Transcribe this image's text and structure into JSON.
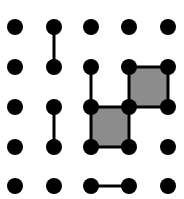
{
  "game": {
    "name": "Dots and Boxes",
    "grid": {
      "cols": 5,
      "rows": 5
    },
    "dot_x": [
      15,
      54,
      91,
      129,
      168
    ],
    "dot_y": [
      27,
      67,
      107,
      147,
      186
    ],
    "dot_radius": 8,
    "colors": {
      "dot": "#000000",
      "line": "#000000",
      "box_fill": "#8c8c8c",
      "background": "#ffffff"
    },
    "lines": [
      {
        "from": [
          1,
          0
        ],
        "to": [
          1,
          1
        ]
      },
      {
        "from": [
          2,
          1
        ],
        "to": [
          2,
          2
        ]
      },
      {
        "from": [
          3,
          1
        ],
        "to": [
          4,
          1
        ]
      },
      {
        "from": [
          3,
          1
        ],
        "to": [
          3,
          2
        ]
      },
      {
        "from": [
          4,
          1
        ],
        "to": [
          4,
          2
        ]
      },
      {
        "from": [
          3,
          2
        ],
        "to": [
          4,
          2
        ]
      },
      {
        "from": [
          2,
          2
        ],
        "to": [
          3,
          2
        ]
      },
      {
        "from": [
          2,
          2
        ],
        "to": [
          2,
          3
        ]
      },
      {
        "from": [
          3,
          2
        ],
        "to": [
          3,
          3
        ]
      },
      {
        "from": [
          2,
          3
        ],
        "to": [
          3,
          3
        ]
      },
      {
        "from": [
          1,
          2
        ],
        "to": [
          1,
          3
        ]
      },
      {
        "from": [
          2,
          4
        ],
        "to": [
          3,
          4
        ]
      }
    ],
    "boxes": [
      {
        "col": 3,
        "row": 1,
        "filled": true
      },
      {
        "col": 2,
        "row": 2,
        "filled": true
      }
    ]
  }
}
